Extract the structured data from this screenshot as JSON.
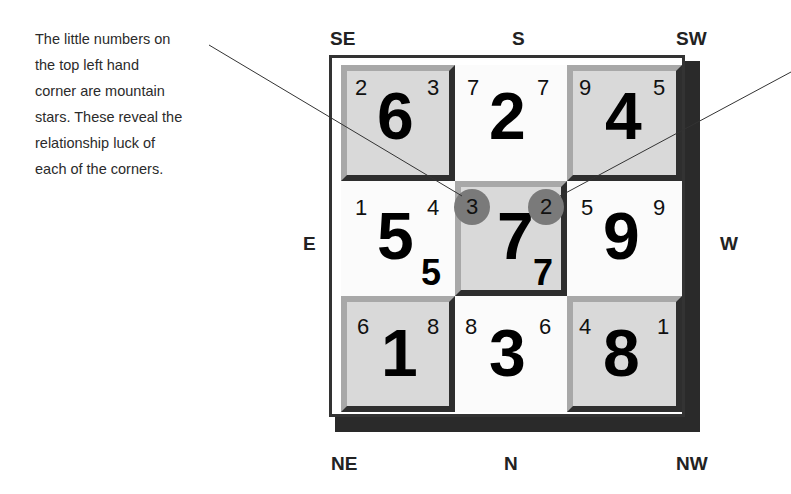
{
  "caption": {
    "lines": [
      "The little numbers on",
      "the top left hand",
      "corner are mountain",
      "stars. These reveal the",
      "relationship luck of",
      "each of the corners."
    ]
  },
  "directions": {
    "top_left": "SE",
    "top_center": "S",
    "top_right": "SW",
    "middle_left": "E",
    "middle_right": "W",
    "bottom_left": "NE",
    "bottom_center": "N",
    "bottom_right": "NW"
  },
  "grid": {
    "cells": [
      {
        "position": "SE",
        "main": "6",
        "left": "2",
        "right": "3",
        "style": "raised"
      },
      {
        "position": "S",
        "main": "2",
        "left": "7",
        "right": "7",
        "style": "flat"
      },
      {
        "position": "SW",
        "main": "4",
        "left": "9",
        "right": "5",
        "style": "raised"
      },
      {
        "position": "E",
        "main": "5",
        "left": "1",
        "right": "4",
        "sub": "5",
        "style": "flat"
      },
      {
        "position": "Center",
        "main": "7",
        "left": "3",
        "right": "2",
        "sub": "7",
        "style": "raised",
        "highlighted": true
      },
      {
        "position": "W",
        "main": "9",
        "left": "5",
        "right": "9",
        "style": "flat"
      },
      {
        "position": "NE",
        "main": "1",
        "left": "6",
        "right": "8",
        "style": "raised"
      },
      {
        "position": "N",
        "main": "3",
        "left": "8",
        "right": "6",
        "style": "flat"
      },
      {
        "position": "NW",
        "main": "8",
        "left": "4",
        "right": "1",
        "style": "raised"
      }
    ]
  },
  "colors": {
    "raised_cell": "#d9d9d9",
    "highlight_circle": "#7a7a7a",
    "frame": "#2a2a2a"
  }
}
